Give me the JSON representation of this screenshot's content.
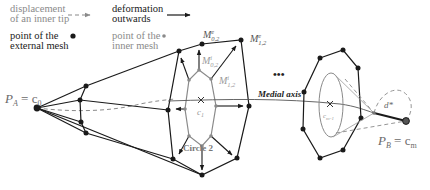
{
  "legend": {
    "inner_tip_displacement": {
      "line1": "displacement",
      "line2": "of an inner tip"
    },
    "deformation": {
      "line1": "deformation",
      "line2": "outwards"
    },
    "external_point": {
      "line1": "point of the",
      "line2": "external mesh"
    },
    "internal_point": {
      "line1": "point of the",
      "line2": "inner mesh"
    }
  },
  "labels": {
    "pa": "P",
    "pa_sub": "A",
    "pa_eq": " = c",
    "pa_eq_sub": "0",
    "pb": "P",
    "pb_sub": "B",
    "pb_eq": " = c",
    "pb_eq_sub": "m",
    "m02e": "M",
    "m02e_sup": "e",
    "m02e_sub": "0,2",
    "m12e": "M",
    "m12e_sup": "e",
    "m12e_sub": "1,2",
    "m02i": "M",
    "m02i_sup": "i",
    "m02i_sub": "0,2",
    "m12i": "M",
    "m12i_sup": "i",
    "m12i_sub": "1,2",
    "c_center": "c",
    "c_center_sub": "1",
    "c_prev": "c",
    "c_prev_sub": "m-1",
    "medial_axis": "Medial axis",
    "circle": "Circle 2",
    "ellipsis": "•••",
    "d_star": "d*"
  },
  "colors": {
    "external": "#1a1a1a",
    "internal": "#8a8a8a",
    "dashed": "#8a8a8a",
    "background": "#ffffff"
  }
}
